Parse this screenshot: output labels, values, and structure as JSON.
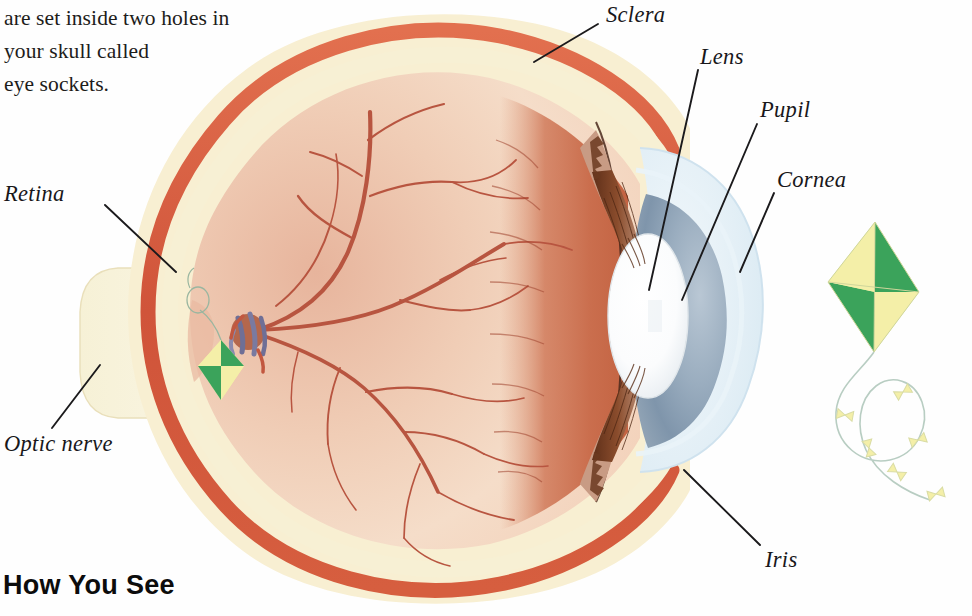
{
  "body_text": {
    "lines": [
      "are set inside two holes in",
      "your skull called",
      "eye sockets."
    ]
  },
  "heading": "How You See",
  "figure": {
    "labels": [
      {
        "id": "sclera",
        "text": "Sclera",
        "x": 606,
        "y": 2,
        "leader": [
          598,
          24,
          534,
          62
        ]
      },
      {
        "id": "lens",
        "text": "Lens",
        "x": 700,
        "y": 44,
        "leader": [
          698,
          70,
          649,
          290
        ]
      },
      {
        "id": "pupil",
        "text": "Pupil",
        "x": 760,
        "y": 97,
        "leader": [
          757,
          124,
          682,
          300
        ]
      },
      {
        "id": "cornea",
        "text": "Cornea",
        "x": 777,
        "y": 167,
        "leader": [
          774,
          193,
          740,
          272
        ]
      },
      {
        "id": "retina",
        "text": "Retina",
        "x": 4,
        "y": 181,
        "leader": [
          105,
          205,
          176,
          272
        ]
      },
      {
        "id": "optic-nerve",
        "text": "Optic nerve",
        "x": 4,
        "y": 431,
        "leader": [
          52,
          428,
          100,
          365
        ]
      },
      {
        "id": "iris",
        "text": "Iris",
        "x": 765,
        "y": 547,
        "leader": [
          760,
          545,
          684,
          470
        ]
      }
    ],
    "parts": [
      "sclera",
      "choroid",
      "retina",
      "vitreous-body",
      "optic-nerve",
      "optic-disc",
      "retinal-blood-vessels",
      "lens",
      "iris",
      "pupil",
      "cornea",
      "anterior-chamber",
      "inverted-kite-image"
    ]
  },
  "kite": {
    "name": "green-and-yellow-kite",
    "tail_bows": 6
  },
  "colors": {
    "sclera_cream": "#f7ecc9",
    "choroid_red": "#d4583c",
    "retina_pink": "#dfa089",
    "vitreous_light": "#f3d8c4",
    "vitreous_shadow": "#c9674a",
    "vessel_red": "#b8543f",
    "lens_white": "#fdfdfd",
    "iris_brown": "#7c4226",
    "cornea_blue": "#e5eef4",
    "chamber_blue": "#8fa3b8",
    "kite_green": "#3ba35b",
    "kite_yellow": "#f4efa8",
    "ink": "#18171a",
    "paper": "#fefefe"
  }
}
